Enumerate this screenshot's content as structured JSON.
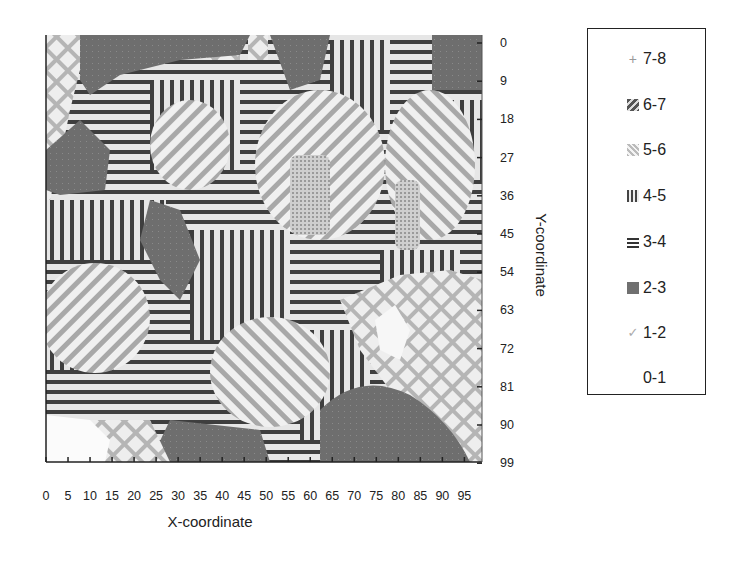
{
  "chart_data": {
    "type": "heatmap",
    "subtype": "filled-contour (hatched grayscale)",
    "title": "",
    "xlabel": "X-coordinate",
    "ylabel": "Y-coordinate",
    "x_ticks": [
      0,
      5,
      10,
      15,
      20,
      25,
      30,
      35,
      40,
      45,
      50,
      55,
      60,
      65,
      70,
      75,
      80,
      85,
      90,
      95
    ],
    "y_ticks": [
      0,
      9,
      18,
      27,
      36,
      45,
      54,
      63,
      72,
      81,
      90,
      99
    ],
    "xlim": [
      0,
      99
    ],
    "ylim": [
      0,
      99
    ],
    "y_axis_side": "right",
    "y_axis_inverted": true,
    "legend_position": "right",
    "legend": [
      {
        "label": "7-8",
        "pattern": "plus",
        "color": "#9a9a9a"
      },
      {
        "label": "6-7",
        "pattern": "diagonal-heavy",
        "color": "#6a6a6a"
      },
      {
        "label": "5-6",
        "pattern": "diagonal-light",
        "color": "#bdbdbd"
      },
      {
        "label": "4-5",
        "pattern": "vertical-stripes",
        "color": "#444444"
      },
      {
        "label": "3-4",
        "pattern": "horizontal-stripes",
        "color": "#444444"
      },
      {
        "label": "2-3",
        "pattern": "solid-gray",
        "color": "#6e6e6e"
      },
      {
        "label": "1-2",
        "pattern": "crosshatch",
        "color": "#b8b8b8"
      },
      {
        "label": "0-1",
        "pattern": "white",
        "color": "#ffffff"
      }
    ],
    "regions_approx": [
      {
        "class": "1-2",
        "area": "left strip x 0-5, y 0-45"
      },
      {
        "class": "2-3",
        "area": "top band x 10-30, y 0-8"
      },
      {
        "class": "3-4",
        "area": "top-left lobe x 15-45, y 3-25"
      },
      {
        "class": "5-6",
        "area": "ellipse x 25-40, y 20-40"
      },
      {
        "class": "5-6",
        "area": "ellipse x 50-70, y 15-50"
      },
      {
        "class": "6-7",
        "area": "inner x 57-65, y 25-45"
      },
      {
        "class": "5-6",
        "area": "ellipse x 78-95, y 20-45"
      },
      {
        "class": "2-3",
        "area": "top-right block x 88-99, y 0-12"
      },
      {
        "class": "5-6",
        "area": "ellipse x 2-22, y 53-77"
      },
      {
        "class": "1-2",
        "area": "right lobe x 68-99, y 55-90"
      },
      {
        "class": "0-1",
        "area": "x 73-80, y 62-72"
      },
      {
        "class": "2-3",
        "area": "bottom-right arc x 70-99, y 75-99"
      },
      {
        "class": "2-3",
        "area": "bottom band x 25-45, y 85-99"
      },
      {
        "class": "0-1",
        "area": "bottom-left x 0-12, y 88-99"
      },
      {
        "class": "4-5",
        "area": "mixed x 40-75, y 35-60"
      },
      {
        "class": "3-4",
        "area": "background mixed bands"
      }
    ]
  },
  "axes": {
    "x_title": "X-coordinate",
    "y_title": "Y-coordinate",
    "x_tick_labels": [
      "0",
      "5",
      "10",
      "15",
      "20",
      "25",
      "30",
      "35",
      "40",
      "45",
      "50",
      "55",
      "60",
      "65",
      "70",
      "75",
      "80",
      "85",
      "90",
      "95"
    ],
    "y_tick_labels": [
      "0",
      "9",
      "18",
      "27",
      "36",
      "45",
      "54",
      "63",
      "72",
      "81",
      "90",
      "99"
    ]
  },
  "legend": {
    "items": [
      {
        "label": "7-8",
        "icon": "plus-swatch"
      },
      {
        "label": "6-7",
        "icon": "diagonal-heavy-swatch"
      },
      {
        "label": "5-6",
        "icon": "diagonal-light-swatch"
      },
      {
        "label": "4-5",
        "icon": "vertical-stripes-swatch"
      },
      {
        "label": "3-4",
        "icon": "horizontal-stripes-swatch"
      },
      {
        "label": "2-3",
        "icon": "solid-gray-swatch"
      },
      {
        "label": "1-2",
        "icon": "crosshatch-swatch"
      },
      {
        "label": "0-1",
        "icon": "white-swatch"
      }
    ]
  }
}
